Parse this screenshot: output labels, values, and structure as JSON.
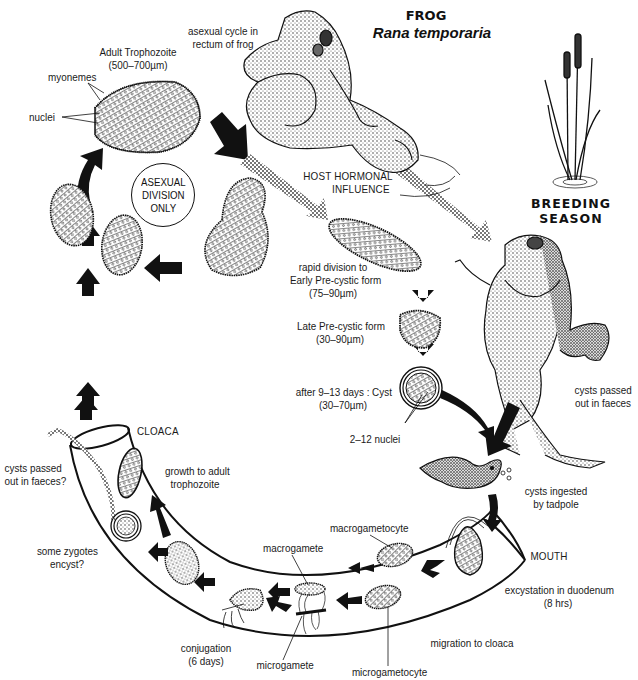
{
  "title": {
    "common_name": "FROG",
    "species": "Rana temporaria"
  },
  "colors": {
    "ink": "#111111",
    "background": "#ffffff",
    "stipple_arrow": "#8a8a8a"
  },
  "labels": {
    "asexual_cycle": [
      "asexual cycle in",
      "rectum of frog"
    ],
    "adult_trophozoite": [
      "Adult Trophozoite",
      "(500–700µm)"
    ],
    "myonemes": "myonemes",
    "nuclei": "nuclei",
    "asexual_division": [
      "ASEXUAL",
      "DIVISION",
      "ONLY"
    ],
    "host_hormonal": [
      "HOST HORMONAL",
      "INFLUENCE"
    ],
    "breeding_season": [
      "BREEDING",
      "SEASON"
    ],
    "early_precystic": [
      "rapid division to",
      "Early Pre-cystic form",
      "(75–90µm)"
    ],
    "late_precystic": [
      "Late Pre-cystic form",
      "(30–90µm)"
    ],
    "cyst": [
      "after 9–13 days : Cyst",
      "(30–70µm)"
    ],
    "cyst_nuclei": "2–12 nuclei",
    "cysts_passed_faeces": [
      "cysts passed",
      "out in faeces"
    ],
    "cysts_ingested": [
      "cysts ingested",
      "by tadpole"
    ],
    "cloaca": "CLOACA",
    "cysts_passed_faeces_q": [
      "cysts passed",
      "out in faeces?"
    ],
    "growth_adult": [
      "growth to adult",
      "trophozoite"
    ],
    "some_zygotes": [
      "some zygotes",
      "encyst?"
    ],
    "macrogametocyte": "macrogametocyte",
    "macrogamete": "macrogamete",
    "mouth": "MOUTH",
    "excystation": [
      "excystation in duodenum",
      "(8 hrs)"
    ],
    "migration": "migration to cloaca",
    "conjugation": [
      "conjugation",
      "(6 days)"
    ],
    "microgamete": "microgamete",
    "microgametocyte": "microgametocyte"
  }
}
